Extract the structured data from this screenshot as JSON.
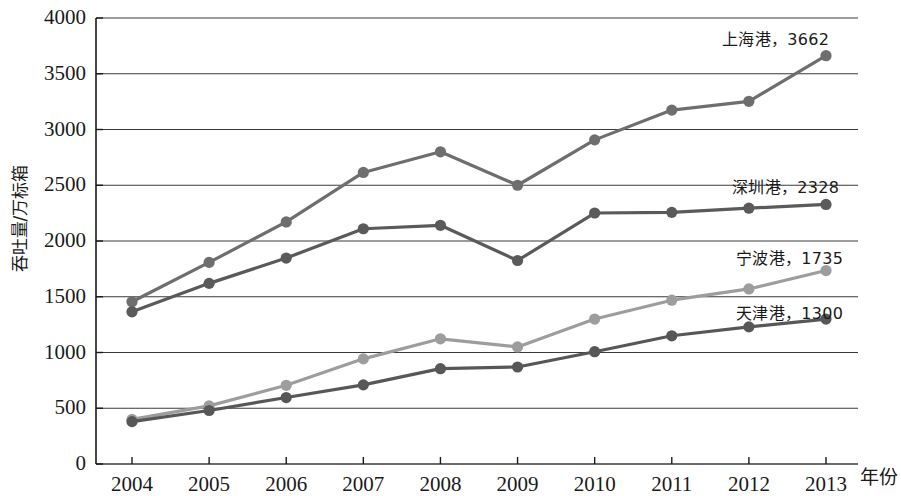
{
  "chart_data": {
    "type": "line",
    "title": "",
    "xlabel": "年份",
    "ylabel": "吞吐量/万标箱",
    "x": [
      "2004",
      "2005",
      "2006",
      "2007",
      "2008",
      "2009",
      "2010",
      "2011",
      "2012",
      "2013"
    ],
    "xlim": [
      2004,
      2013
    ],
    "ylim": [
      0,
      4000
    ],
    "yticks": [
      "0",
      "500",
      "1000",
      "1500",
      "2000",
      "2500",
      "3000",
      "3500",
      "4000"
    ],
    "grid": true,
    "legend_position": "inline-right-end-labels",
    "series": [
      {
        "name": "上海港",
        "end_label": "上海港，3662",
        "end_value": 3662,
        "color": "#6e6e6e",
        "values": [
          1455,
          1808,
          2171,
          2615,
          2800,
          2500,
          2907,
          3174,
          3253,
          3662
        ]
      },
      {
        "name": "深圳港",
        "end_label": "深圳港，2328",
        "end_value": 2328,
        "color": "#5a5a5a",
        "values": [
          1365,
          1620,
          1847,
          2110,
          2141,
          1825,
          2251,
          2257,
          2294,
          2328
        ]
      },
      {
        "name": "宁波港",
        "end_label": "宁波港，1735",
        "end_value": 1735,
        "color": "#9d9d9d",
        "values": [
          400,
          521,
          706,
          943,
          1123,
          1050,
          1300,
          1469,
          1570,
          1735
        ]
      },
      {
        "name": "天津港",
        "end_label": "天津港，1300",
        "end_value": 1300,
        "color": "#575757",
        "values": [
          380,
          480,
          596,
          710,
          855,
          870,
          1007,
          1150,
          1230,
          1300
        ]
      }
    ]
  },
  "axes": {
    "y_title": "吞吐量/万标箱",
    "x_title": "年份"
  },
  "labels": {
    "shanghai": "上海港，3662",
    "shenzhen": "深圳港，2328",
    "ningbo": "宁波港，1735",
    "tianjin": "天津港，1300"
  },
  "colors": {
    "axis": "#1a1a1a",
    "grid": "#3a3a3a",
    "background": "#ffffff"
  }
}
